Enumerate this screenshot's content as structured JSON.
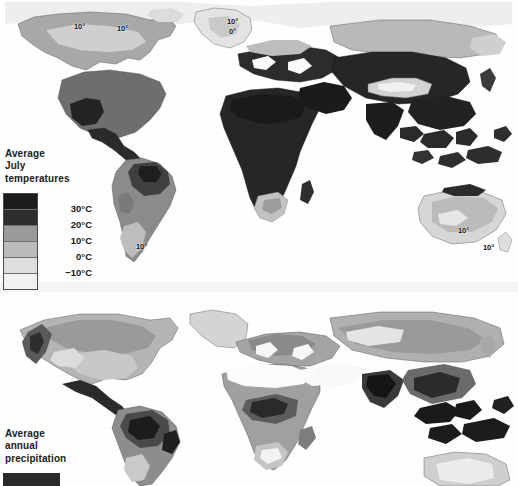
{
  "figure": {
    "background_color": "#fdfdfd",
    "panel_count": 2
  },
  "maps": [
    {
      "id": "july-temperature",
      "title_lines": [
        "Average",
        "July",
        "temperatures"
      ],
      "projection": "world-equirectangular",
      "variable": "Average July temperature",
      "legend": {
        "type": "graduated-grayscale",
        "labels": [
          "30°C",
          "20°C",
          "10°C",
          "0°C",
          "−10°C"
        ],
        "swatch_colors": [
          "#1c1c1c",
          "#2d2d2d",
          "#9a9a9a",
          "#bcbcbc",
          "#dedede",
          "#f1f1f1"
        ],
        "band_count": 6
      },
      "annotations": [
        {
          "text": "10°",
          "x": 74,
          "y": 22
        },
        {
          "text": "10°",
          "x": 117,
          "y": 24
        },
        {
          "text": "10°",
          "x": 227,
          "y": 17
        },
        {
          "text": "0°",
          "x": 229,
          "y": 27
        },
        {
          "text": "10°",
          "x": 136,
          "y": 242
        },
        {
          "text": "10°",
          "x": 458,
          "y": 226
        },
        {
          "text": "10°",
          "x": 483,
          "y": 243
        }
      ]
    },
    {
      "id": "annual-precipitation",
      "title_lines": [
        "Average",
        "annual",
        "precipitation"
      ],
      "projection": "world-equirectangular",
      "variable": "Average annual precipitation",
      "legend": {
        "type": "graduated-grayscale",
        "labels": [],
        "swatch_colors": [
          "#2a2a2a"
        ],
        "band_count": 1,
        "note_clipped": "legend continues below image edge"
      },
      "annotations": []
    }
  ]
}
